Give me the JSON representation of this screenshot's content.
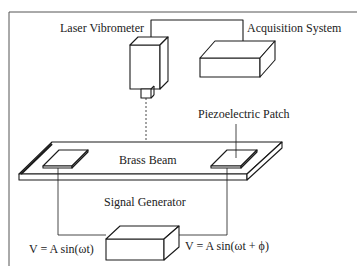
{
  "diagram": {
    "labels": {
      "laser_vibrometer": "Laser Vibrometer",
      "acquisition_system": "Acquisition System",
      "piezoelectric_patch": "Piezoelectric Patch",
      "brass_beam": "Brass Beam",
      "signal_generator": "Signal Generator",
      "voltage_left": "V = A sin(ωt)",
      "voltage_right": "V = A sin(ωt + ϕ)"
    },
    "colors": {
      "line": "#1a1a1a",
      "frame": "#555555",
      "background": "#ffffff"
    }
  }
}
